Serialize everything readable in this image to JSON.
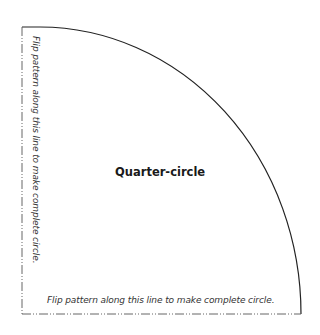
{
  "diagram": {
    "title": "Quarter-circle",
    "bottom_label": "Flip pattern along this line to make complete circle.",
    "left_label": "Flip pattern along this line to make complete circle.",
    "colors": {
      "line": "#222222",
      "fold_line": "#555555",
      "background": "#ffffff"
    }
  }
}
